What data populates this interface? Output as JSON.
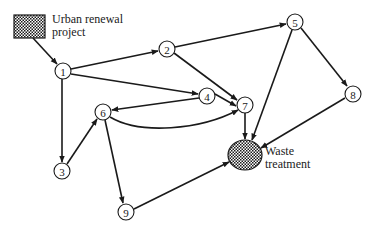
{
  "diagram": {
    "type": "directed-network",
    "source": {
      "label_line1": "Urban renewal",
      "label_line2": "project",
      "shape": "hatched-rectangle"
    },
    "sink": {
      "label_line1": "Waste",
      "label_line2": "treatment",
      "shape": "hatched-ellipse"
    },
    "nodes": [
      {
        "id": "1",
        "label": "1"
      },
      {
        "id": "2",
        "label": "2"
      },
      {
        "id": "3",
        "label": "3"
      },
      {
        "id": "4",
        "label": "4"
      },
      {
        "id": "5",
        "label": "5"
      },
      {
        "id": "6",
        "label": "6"
      },
      {
        "id": "7",
        "label": "7"
      },
      {
        "id": "8",
        "label": "8"
      },
      {
        "id": "9",
        "label": "9"
      }
    ],
    "edges": [
      {
        "from": "source",
        "to": "1"
      },
      {
        "from": "1",
        "to": "2"
      },
      {
        "from": "1",
        "to": "4"
      },
      {
        "from": "1",
        "to": "3"
      },
      {
        "from": "2",
        "to": "5"
      },
      {
        "from": "2",
        "to": "7"
      },
      {
        "from": "4",
        "to": "7"
      },
      {
        "from": "4",
        "to": "6"
      },
      {
        "from": "6",
        "to": "7",
        "curved": true
      },
      {
        "from": "3",
        "to": "6"
      },
      {
        "from": "6",
        "to": "9"
      },
      {
        "from": "5",
        "to": "8"
      },
      {
        "from": "5",
        "to": "sink"
      },
      {
        "from": "7",
        "to": "sink"
      },
      {
        "from": "8",
        "to": "sink"
      },
      {
        "from": "9",
        "to": "sink"
      }
    ],
    "colors": {
      "line": "#1a1a1a",
      "background": "#ffffff"
    }
  }
}
